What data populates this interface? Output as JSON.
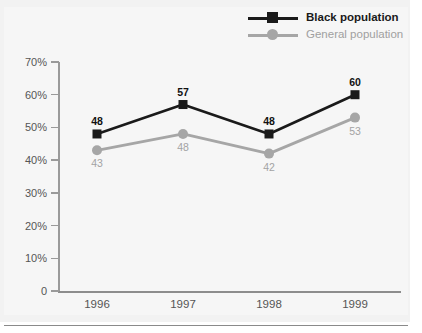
{
  "chart_data": {
    "type": "line",
    "title": "",
    "subtitle": "",
    "xlabel": "",
    "ylabel": "",
    "categories": [
      "1996",
      "1997",
      "1998",
      "1999"
    ],
    "series": [
      {
        "name": "Black population",
        "color": "#1a1a1a",
        "marker": "square",
        "values": [
          48,
          57,
          48,
          60
        ],
        "labels": [
          "48",
          "57",
          "48",
          "60"
        ]
      },
      {
        "name": "General population",
        "color": "#a6a6a6",
        "marker": "circle",
        "values": [
          43,
          48,
          42,
          53
        ],
        "labels": [
          "43",
          "48",
          "42",
          "53"
        ]
      }
    ],
    "ylim": [
      0,
      70
    ],
    "y_ticks": [
      0,
      10,
      20,
      30,
      40,
      50,
      60,
      70
    ],
    "y_tick_labels": [
      "0",
      "10%",
      "20%",
      "30%",
      "40%",
      "50%",
      "60%",
      "70%"
    ],
    "grid": false,
    "legend_position": "top-right",
    "value_labels": true
  },
  "legend": {
    "items": [
      {
        "label": "Black population",
        "marker": "square-marker",
        "color": "#1a1a1a"
      },
      {
        "label": "General population",
        "marker": "circle-marker",
        "color": "#a6a6a6"
      }
    ]
  },
  "axes": {
    "y_tick_labels": [
      "70%",
      "60%",
      "50%",
      "40%",
      "30%",
      "20%",
      "10%",
      "0"
    ],
    "x_tick_labels": [
      "1996",
      "1997",
      "1998",
      "1999"
    ]
  },
  "colors": {
    "page_background": "#ffffff",
    "panel_background": "#f2f2f2",
    "plot_background": "#f6f6f6",
    "series_black": "#1a1a1a",
    "series_gray": "#a6a6a6",
    "axis": "#9a9a9a",
    "tick_text": "#555555",
    "rule": "#8a8a8a"
  }
}
